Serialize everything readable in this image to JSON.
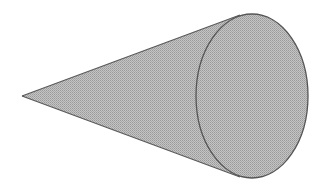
{
  "diagram": {
    "type": "cone",
    "orientation": "horizontal, apex pointing left",
    "apex": {
      "x": 22,
      "y": 96
    },
    "base_ellipse": {
      "cx": 252,
      "cy": 96,
      "rx": 56,
      "ry": 82
    },
    "tangent_top": {
      "x": 240,
      "y": 15
    },
    "tangent_bottom": {
      "x": 240,
      "y": 177
    },
    "fill_color": "#b4b4b4",
    "stroke_color": "#555555",
    "background_color": "#ffffff",
    "texture": "stippled halftone gray"
  }
}
